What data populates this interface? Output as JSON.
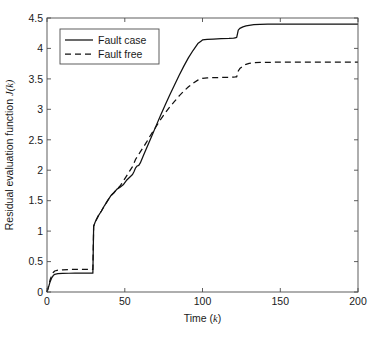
{
  "chart_data": {
    "type": "line",
    "title": "",
    "xlabel": "Time (k)",
    "ylabel": "Residual evaluation function J(k)",
    "xlim": [
      0,
      200
    ],
    "ylim": [
      0,
      4.5
    ],
    "xticks": [
      0,
      50,
      100,
      150,
      200
    ],
    "xticklabels": [
      "0",
      "50",
      "100",
      "150",
      "200"
    ],
    "yticks": [
      0,
      0.5,
      1,
      1.5,
      2,
      2.5,
      3,
      3.5,
      4,
      4.5
    ],
    "yticklabels": [
      "0",
      "0.5",
      "1",
      "1.5",
      "2",
      "2.5",
      "3",
      "3.5",
      "4",
      "4.5"
    ],
    "grid": false,
    "legend_position": "upper left inside axes",
    "background": "#ffffff",
    "frame_color": "#4d4d4d",
    "series": [
      {
        "name": "Fault case",
        "style": "solid",
        "color": "#111111",
        "x": [
          0,
          1,
          2,
          3,
          4,
          5,
          7,
          10,
          14,
          18,
          22,
          26,
          29,
          29.5,
          30,
          31,
          33,
          35,
          37,
          39,
          41,
          43,
          45,
          47,
          49,
          51,
          53,
          55,
          56,
          57,
          58,
          59,
          60,
          62,
          64,
          66,
          68,
          70,
          73,
          76,
          79,
          82,
          85,
          88,
          91,
          94,
          97,
          99,
          100,
          103,
          107,
          112,
          117,
          120,
          121,
          122,
          123,
          124,
          126,
          128,
          130,
          133,
          137,
          142,
          150,
          160,
          175,
          190,
          200
        ],
        "y": [
          0,
          0.08,
          0.17,
          0.23,
          0.27,
          0.29,
          0.3,
          0.305,
          0.308,
          0.31,
          0.31,
          0.31,
          0.31,
          0.31,
          1.08,
          1.15,
          1.25,
          1.33,
          1.42,
          1.5,
          1.58,
          1.63,
          1.69,
          1.72,
          1.76,
          1.83,
          1.88,
          1.93,
          1.98,
          2.04,
          2.07,
          2.08,
          2.12,
          2.24,
          2.36,
          2.48,
          2.6,
          2.72,
          2.9,
          3.07,
          3.24,
          3.4,
          3.56,
          3.71,
          3.85,
          3.97,
          4.08,
          4.12,
          4.14,
          4.15,
          4.155,
          4.16,
          4.165,
          4.17,
          4.175,
          4.18,
          4.3,
          4.33,
          4.355,
          4.37,
          4.38,
          4.39,
          4.395,
          4.4,
          4.4,
          4.4,
          4.4,
          4.4,
          4.4
        ]
      },
      {
        "name": "Fault free",
        "style": "dashed",
        "color": "#111111",
        "x": [
          0,
          1,
          2,
          3,
          4,
          5,
          7,
          10,
          14,
          18,
          22,
          26,
          29,
          29.5,
          30,
          31,
          33,
          35,
          37,
          39,
          41,
          43,
          45,
          47,
          49,
          51,
          53,
          55,
          56,
          57,
          58,
          59,
          60,
          62,
          64,
          66,
          68,
          70,
          73,
          76,
          79,
          82,
          85,
          88,
          91,
          94,
          97,
          99,
          100,
          103,
          107,
          112,
          117,
          120,
          121,
          122,
          123,
          124,
          126,
          128,
          130,
          133,
          137,
          142,
          150,
          160,
          175,
          190,
          200
        ],
        "y": [
          0,
          0.1,
          0.2,
          0.27,
          0.32,
          0.345,
          0.36,
          0.365,
          0.37,
          0.37,
          0.37,
          0.37,
          0.37,
          0.37,
          1.08,
          1.15,
          1.25,
          1.33,
          1.42,
          1.5,
          1.58,
          1.63,
          1.69,
          1.74,
          1.82,
          1.9,
          1.98,
          2.06,
          2.12,
          2.18,
          2.22,
          2.26,
          2.3,
          2.38,
          2.46,
          2.55,
          2.63,
          2.71,
          2.83,
          2.94,
          3.04,
          3.13,
          3.22,
          3.3,
          3.37,
          3.43,
          3.48,
          3.5,
          3.51,
          3.515,
          3.52,
          3.523,
          3.526,
          3.53,
          3.532,
          3.535,
          3.63,
          3.67,
          3.71,
          3.74,
          3.755,
          3.765,
          3.77,
          3.772,
          3.775,
          3.775,
          3.775,
          3.775,
          3.775
        ]
      }
    ]
  },
  "legend": {
    "entries": [
      {
        "label": "Fault case",
        "style": "solid"
      },
      {
        "label": "Fault free",
        "style": "dashed"
      }
    ]
  },
  "axis": {
    "x_title_main": "Time (",
    "x_title_italic": "k",
    "x_title_close": ")",
    "y_title_main": "Residual evaluation function ",
    "y_title_italic": "J(k)"
  }
}
